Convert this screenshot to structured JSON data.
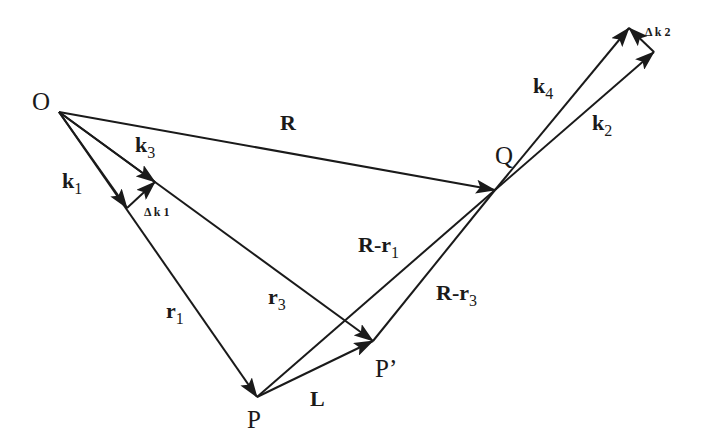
{
  "diagram": {
    "type": "vector-geometry",
    "points": {
      "O": {
        "label": "O",
        "x": 59,
        "y": 112
      },
      "Q": {
        "label": "Q",
        "x": 495,
        "y": 190
      },
      "P": {
        "label": "P",
        "x": 257,
        "y": 397
      },
      "P_prime": {
        "label": "P’",
        "x": 373,
        "y": 341
      }
    },
    "vectors": [
      {
        "id": "R",
        "label": "R",
        "sub": "",
        "from": "O",
        "to": "Q"
      },
      {
        "id": "k1",
        "label": "k",
        "sub": "1",
        "from": "O",
        "to": "k1_tip"
      },
      {
        "id": "k3",
        "label": "k",
        "sub": "3",
        "from": "O",
        "to": "k3_tip"
      },
      {
        "id": "r1",
        "label": "r",
        "sub": "1",
        "from": "O",
        "to": "P"
      },
      {
        "id": "r3",
        "label": "r",
        "sub": "3",
        "from": "O",
        "to": "P_prime"
      },
      {
        "id": "L",
        "label": "L",
        "sub": "",
        "from": "P",
        "to": "P_prime"
      },
      {
        "id": "R-r1",
        "label": "R-r",
        "sub": "1",
        "from": "P",
        "to": "Q"
      },
      {
        "id": "R-r3",
        "label": "R-r",
        "sub": "3",
        "from": "P_prime",
        "to": "Q"
      },
      {
        "id": "k4",
        "label": "k",
        "sub": "4",
        "from": "Q",
        "to": "k4_tip"
      },
      {
        "id": "k2",
        "label": "k",
        "sub": "2",
        "from": "Q",
        "to": "k2_tip"
      },
      {
        "id": "dk1",
        "label": "Δ k 1",
        "from": "k1_tip",
        "to": "k3_tip"
      },
      {
        "id": "dk2",
        "label": "Δ k 2",
        "from": "k2_tip",
        "to": "k4_tip"
      }
    ],
    "labels": {
      "O": "O",
      "Q": "Q",
      "P": "P",
      "P_prime": "P’",
      "R": "R",
      "k": "k",
      "k1_sub": "1",
      "k2_sub": "2",
      "k3_sub": "3",
      "k4_sub": "4",
      "r": "r",
      "r1_sub": "1",
      "r3_sub": "3",
      "L": "L",
      "R_minus_r": "R-r",
      "dk1": "Δ k 1",
      "dk2": "Δ k 2"
    },
    "stroke_color": "#1a1a1a",
    "background": "#ffffff"
  }
}
